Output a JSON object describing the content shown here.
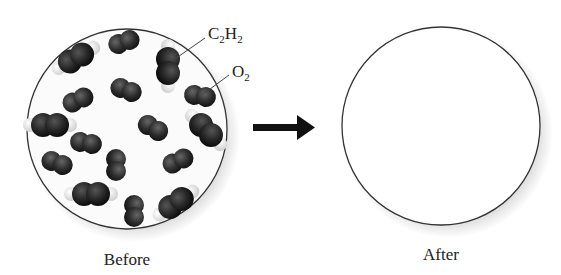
{
  "diagram": {
    "before": {
      "caption": "Before",
      "labels": [
        {
          "formula": "C",
          "sub1": "2",
          "mid": "H",
          "sub2": "2",
          "name": "C2H2"
        },
        {
          "formula": "O",
          "sub1": "2",
          "name": "O2"
        }
      ]
    },
    "arrow": {
      "direction": "right"
    },
    "after": {
      "caption": "After"
    }
  },
  "colors": {
    "molecule_dark": "#1e1e1e",
    "hydrogen": "#e8e8e8",
    "circle_outline": "#333333",
    "arrow": "#111111"
  }
}
